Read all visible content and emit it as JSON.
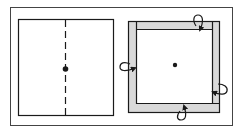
{
  "diagram": {
    "colors": {
      "stroke": "#1a1a1a",
      "frame": "#444444",
      "strip_fill": "#d9d9d9",
      "background": "#ffffff"
    },
    "panels": [
      {
        "id": "left",
        "elements": [
          "square",
          "dashed-vertical-fold-line",
          "center-dot"
        ]
      },
      {
        "id": "right",
        "elements": [
          "square",
          "top-strip",
          "right-strip",
          "bottom-strip",
          "left-strip",
          "fold-arrow-top",
          "fold-arrow-right",
          "fold-arrow-bottom",
          "fold-arrow-left",
          "center-dot"
        ]
      }
    ]
  }
}
